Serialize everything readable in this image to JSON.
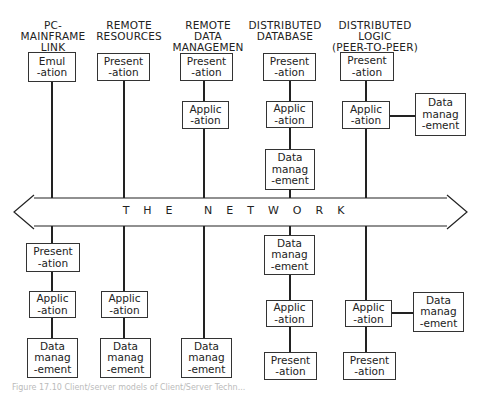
{
  "columns": [
    {
      "title": "PC-\nMAINFRAME\nLINK",
      "top": [
        {
          "label1": "Emul",
          "label2": "-ation"
        }
      ],
      "bottom": [
        {
          "label1": "Present",
          "label2": "-ation"
        },
        {
          "label1": "Applic",
          "label2": "-ation"
        },
        {
          "label1": "Data",
          "label2": "manag",
          "label3": "-ement"
        }
      ]
    },
    {
      "title": "REMOTE\nRESOURCES",
      "top": [
        {
          "label1": "Present",
          "label2": "-ation"
        }
      ],
      "bottom": [
        {
          "label1": "Applic",
          "label2": "-ation"
        },
        {
          "label1": "Data",
          "label2": "manag",
          "label3": "-ement"
        }
      ]
    },
    {
      "title": "REMOTE\nDATA\nMANAGEMEN",
      "top": [
        {
          "label1": "Present",
          "label2": "-ation"
        },
        {
          "label1": "Applic",
          "label2": "-ation"
        }
      ],
      "bottom": [
        {
          "label1": "Data",
          "label2": "manag",
          "label3": "-ement"
        }
      ]
    },
    {
      "title": "DISTRIBUTED\nDATABASE",
      "top": [
        {
          "label1": "Present",
          "label2": "-ation"
        },
        {
          "label1": "Applic",
          "label2": "-ation"
        },
        {
          "label1": "Data",
          "label2": "manag",
          "label3": "-ement"
        }
      ],
      "bottom": [
        {
          "label1": "Data",
          "label2": "manag",
          "label3": "-ement"
        },
        {
          "label1": "Applic",
          "label2": "-ation"
        },
        {
          "label1": "Present",
          "label2": "-ation"
        }
      ]
    },
    {
      "title": "DISTRIBUTED\nLOGIC\n(PEER-TO-PEER)",
      "top": [
        {
          "label1": "Present",
          "label2": "-ation"
        },
        {
          "label1": "Applic",
          "label2": "-ation"
        },
        {
          "label1": "Data",
          "label2": "manag",
          "label3": "-ement"
        }
      ],
      "bottom": [
        {
          "label1": "Applic",
          "label2": "-ation"
        },
        {
          "label1": "Data",
          "label2": "manag",
          "label3": "-ement"
        },
        {
          "label1": "Present",
          "label2": "-ation"
        }
      ]
    }
  ],
  "network": {
    "label": "THE NETWORK"
  },
  "caption": "Figure 17.10  Client/server models of Client/Server Techn..."
}
